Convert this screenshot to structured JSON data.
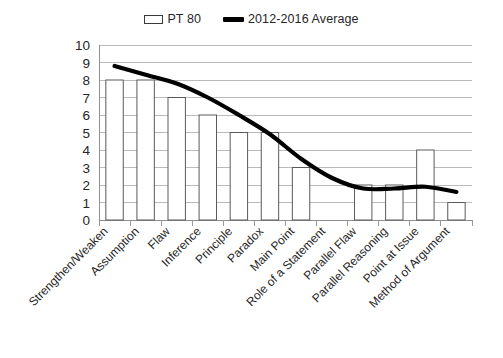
{
  "chart_data": {
    "type": "bar",
    "title": "",
    "xlabel": "",
    "ylabel": "",
    "ylim": [
      0,
      10
    ],
    "ytick_step": 1,
    "grid": "horizontal",
    "legend_position": "top-center",
    "categories": [
      "Strengthen/Weaken",
      "Assumption",
      "Flaw",
      "Inference",
      "Principle",
      "Paradox",
      "Main Point",
      "Role of a Statement",
      "Parallel Flaw",
      "Parallel Reasoning",
      "Point at Issue",
      "Method of Argument"
    ],
    "yticks": [
      "10",
      "9",
      "8",
      "7",
      "6",
      "5",
      "4",
      "3",
      "2",
      "1",
      "0"
    ],
    "series": [
      {
        "name": "PT 80",
        "type": "bar",
        "color": "#ffffff",
        "edge_color": "#5a5a5a",
        "values": [
          8,
          8,
          7,
          6,
          5,
          5,
          3,
          0,
          2,
          2,
          4,
          1
        ]
      },
      {
        "name": "2012-2016 Average",
        "type": "line",
        "color": "#000000",
        "values": [
          8.8,
          8.3,
          7.8,
          7.0,
          6.0,
          4.9,
          3.5,
          2.4,
          1.8,
          1.8,
          1.9,
          1.6
        ]
      }
    ]
  },
  "legend": {
    "entries": [
      {
        "label": "PT 80",
        "marker": "bar-swatch-icon"
      },
      {
        "label": "2012-2016 Average",
        "marker": "line-swatch-icon"
      }
    ]
  }
}
